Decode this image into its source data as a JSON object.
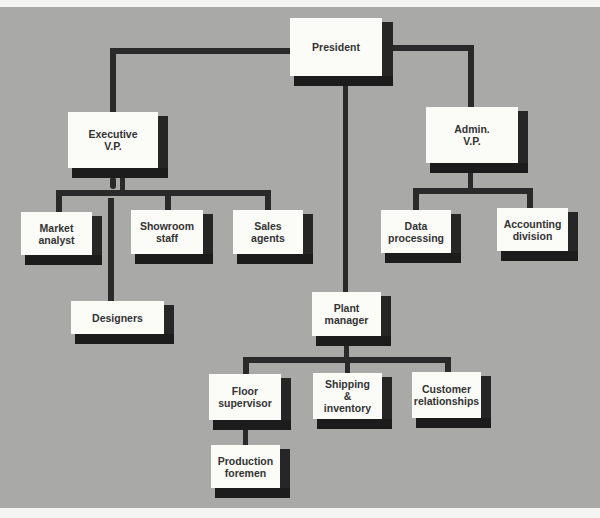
{
  "chart": {
    "type": "org-chart",
    "colors": {
      "background": "#a9a9a7",
      "box": "#fbfbf8",
      "shadow": "#262626",
      "line": "#2a2a2a",
      "text": "#333333"
    },
    "nodes": {
      "president": {
        "label": "President"
      },
      "executive_vp": {
        "label": "Executive\nV.P."
      },
      "admin_vp": {
        "label": "Admin.\nV.P."
      },
      "market_analyst": {
        "label": "Market\nanalyst"
      },
      "showroom_staff": {
        "label": "Showroom\nstaff"
      },
      "sales_agents": {
        "label": "Sales\nagents"
      },
      "designers": {
        "label": "Designers"
      },
      "data_processing": {
        "label": "Data\nprocessing"
      },
      "accounting_division": {
        "label": "Accounting\ndivision"
      },
      "plant_manager": {
        "label": "Plant\nmanager"
      },
      "floor_supervisor": {
        "label": "Floor\nsupervisor"
      },
      "shipping_inventory": {
        "label": "Shipping\n&\ninventory"
      },
      "customer_relationships": {
        "label": "Customer\nrelationships"
      },
      "production_foremen": {
        "label": "Production\nforemen"
      }
    },
    "edges": [
      [
        "President",
        "Executive V.P."
      ],
      [
        "President",
        "Admin. V.P."
      ],
      [
        "President",
        "Plant manager"
      ],
      [
        "Executive V.P.",
        "Market analyst"
      ],
      [
        "Executive V.P.",
        "Showroom staff"
      ],
      [
        "Executive V.P.",
        "Sales agents"
      ],
      [
        "Executive V.P.",
        "Designers"
      ],
      [
        "Admin. V.P.",
        "Data processing"
      ],
      [
        "Admin. V.P.",
        "Accounting division"
      ],
      [
        "Plant manager",
        "Floor supervisor"
      ],
      [
        "Plant manager",
        "Shipping & inventory"
      ],
      [
        "Plant manager",
        "Customer relationships"
      ],
      [
        "Floor supervisor",
        "Production foremen"
      ]
    ]
  }
}
